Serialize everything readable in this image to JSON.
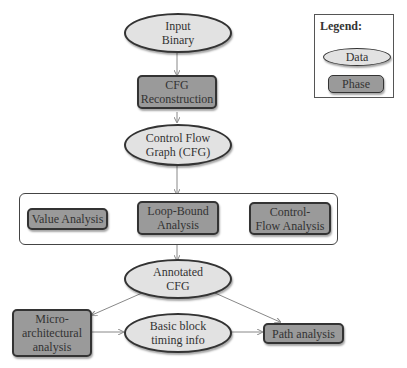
{
  "legend": {
    "title": "Legend:",
    "data_label": "Data",
    "phase_label": "Phase"
  },
  "nodes": {
    "input_binary": "Input\nBinary",
    "cfg_reconstruction": "CFG\nReconstruction",
    "cfg": "Control Flow\nGraph (CFG)",
    "value_analysis": "Value Analysis",
    "loop_bound_analysis": "Loop-Bound\nAnalysis",
    "control_flow_analysis": "Control-\nFlow Analysis",
    "annotated_cfg": "Annotated\nCFG",
    "micro_architectural_analysis": "Micro-\narchitectural\nanalysis",
    "basic_block_timing_info": "Basic  block\ntiming  info",
    "path_analysis": "Path analysis"
  },
  "colors": {
    "data_fill": "#e2e2e2",
    "phase_fill": "#9a9a9a",
    "stroke": "#333333",
    "edge": "#888888"
  }
}
